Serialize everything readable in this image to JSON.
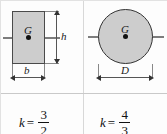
{
  "figure": {
    "columns": [
      {
        "id": "rectangle",
        "shape": "rectangle",
        "centroid_label": "G",
        "dimensions": [
          {
            "name": "height",
            "label": "h",
            "orientation": "vertical"
          },
          {
            "name": "width",
            "label": "b",
            "orientation": "horizontal"
          }
        ],
        "formula": {
          "variable": "k",
          "equals": "=",
          "numerator": "3",
          "denominator": "2"
        }
      },
      {
        "id": "circle",
        "shape": "circle",
        "centroid_label": "G",
        "dimensions": [
          {
            "name": "diameter",
            "label": "D",
            "orientation": "horizontal"
          }
        ],
        "formula": {
          "variable": "k",
          "equals": "=",
          "numerator": "4",
          "denominator": "3"
        }
      }
    ],
    "colors": {
      "fill": "#cdcdcd",
      "outline": "#4a4a4a",
      "axis": "#7d7d7d",
      "rule": "#d8d8d8",
      "text": "#111111",
      "background": "#fdfdfd"
    }
  }
}
